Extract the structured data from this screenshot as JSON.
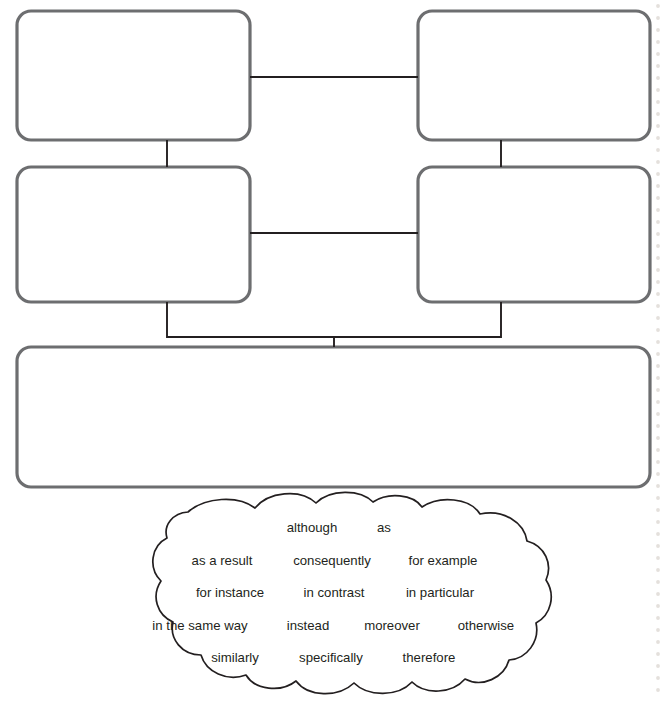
{
  "page": {
    "background_color": "#ffffff",
    "width": 665,
    "height": 705
  },
  "colors": {
    "box_stroke": "#6d6e70",
    "connector_stroke": "#231f20",
    "cloud_stroke": "#231f20",
    "text": "#231f20",
    "binding_dot": "#e4e0dc",
    "box_fill": "#ffffff"
  },
  "organizer": {
    "boxes": [
      {
        "id": "box-top-left",
        "label": "",
        "x": 17,
        "y": 11,
        "w": 233,
        "h": 129,
        "radius": 14
      },
      {
        "id": "box-top-right",
        "label": "",
        "x": 418,
        "y": 11,
        "w": 232,
        "h": 129,
        "radius": 14
      },
      {
        "id": "box-mid-left",
        "label": "",
        "x": 17,
        "y": 167,
        "w": 233,
        "h": 135,
        "radius": 14
      },
      {
        "id": "box-mid-right",
        "label": "",
        "x": 418,
        "y": 167,
        "w": 232,
        "h": 135,
        "radius": 14
      },
      {
        "id": "box-bottom",
        "label": "",
        "x": 17,
        "y": 347,
        "w": 633,
        "h": 140,
        "radius": 14
      }
    ],
    "connectors": [
      {
        "id": "connector-top-horizontal",
        "path": "M 250 77 L 418 77"
      },
      {
        "id": "connector-mid-horizontal",
        "path": "M 250 233 L 418 233"
      },
      {
        "id": "connector-left-vertical",
        "path": "M 167 140 L 167 167"
      },
      {
        "id": "connector-right-vertical",
        "path": "M 501 140 L 501 167"
      },
      {
        "id": "connector-merge-to-bottom",
        "path": "M 167 302 L 167 337 L 501 337 L 501 302"
      },
      {
        "id": "connector-bottom-stub",
        "path": "M 334 337 L 334 347"
      }
    ]
  },
  "word_bank": {
    "name": "transition-words-cloud",
    "rows": [
      {
        "row": 1,
        "y": 532,
        "words": [
          {
            "text": "although",
            "x": 312
          },
          {
            "text": "as",
            "x": 384
          }
        ]
      },
      {
        "row": 2,
        "y": 565,
        "words": [
          {
            "text": "as a result",
            "x": 222
          },
          {
            "text": "consequently",
            "x": 332
          },
          {
            "text": "for example",
            "x": 443
          }
        ]
      },
      {
        "row": 3,
        "y": 597,
        "words": [
          {
            "text": "for instance",
            "x": 230
          },
          {
            "text": "in contrast",
            "x": 334
          },
          {
            "text": "in particular",
            "x": 440
          }
        ]
      },
      {
        "row": 4,
        "y": 630,
        "words": [
          {
            "text": "in the same way",
            "x": 200
          },
          {
            "text": "instead",
            "x": 308
          },
          {
            "text": "moreover",
            "x": 392
          },
          {
            "text": "otherwise",
            "x": 486
          }
        ]
      },
      {
        "row": 5,
        "y": 662,
        "words": [
          {
            "text": "similarly",
            "x": 235
          },
          {
            "text": "specifically",
            "x": 331
          },
          {
            "text": "therefore",
            "x": 429
          }
        ]
      }
    ],
    "all_words": [
      "although",
      "as",
      "as a result",
      "consequently",
      "for example",
      "for instance",
      "in contrast",
      "in particular",
      "in the same way",
      "instead",
      "moreover",
      "otherwise",
      "similarly",
      "specifically",
      "therefore"
    ],
    "cloud_path": "M 188 512 C 205 497 238 495 255 508 C 268 492 300 488 316 503 C 330 489 360 489 373 502 C 388 492 413 494 422 507 C 440 495 470 498 480 514 C 503 509 524 522 527 541 C 545 546 553 564 546 580 C 556 595 551 615 536 623 C 540 641 527 659 509 660 C 504 678 482 688 465 679 C 452 694 425 695 412 682 C 398 697 368 697 354 683 C 338 698 308 697 296 681 C 281 693 255 690 246 675 C 227 682 206 672 201 655 C 182 655 169 639 173 622 C 157 615 151 596 161 581 C 148 568 151 546 167 538 C 163 525 173 513 188 512 Z"
  },
  "page_binding": {
    "name": "spiral-binding-dots",
    "x": 658,
    "dot_radius": 1.9,
    "spacing": 12,
    "count": 58
  }
}
